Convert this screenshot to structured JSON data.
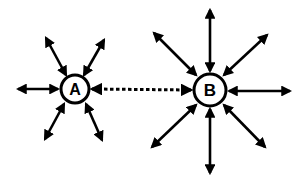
{
  "diagram": {
    "background": "#ffffff",
    "stroke_color": "#000000",
    "nodes": [
      {
        "id": "A",
        "label": "A",
        "cx": 75,
        "cy": 89,
        "r": 14,
        "font_size": 16
      },
      {
        "id": "B",
        "label": "B",
        "cx": 210,
        "cy": 90,
        "r": 16,
        "font_size": 17
      }
    ],
    "arrows": [
      {
        "name": "a-northwest",
        "x1": 46,
        "y1": 38,
        "x2": 66,
        "y2": 75,
        "style": "solid"
      },
      {
        "name": "a-northeast",
        "x1": 104,
        "y1": 40,
        "x2": 84,
        "y2": 75,
        "style": "solid"
      },
      {
        "name": "a-west",
        "x1": 18,
        "y1": 89,
        "x2": 58,
        "y2": 89,
        "style": "solid"
      },
      {
        "name": "a-southwest",
        "x1": 45,
        "y1": 139,
        "x2": 64,
        "y2": 104,
        "style": "solid"
      },
      {
        "name": "a-southeast",
        "x1": 102,
        "y1": 140,
        "x2": 86,
        "y2": 104,
        "style": "solid"
      },
      {
        "name": "a-to-b",
        "x1": 92,
        "y1": 89,
        "x2": 191,
        "y2": 90,
        "style": "dashed"
      },
      {
        "name": "b-northwest",
        "x1": 154,
        "y1": 33,
        "x2": 196,
        "y2": 75,
        "style": "solid"
      },
      {
        "name": "b-north",
        "x1": 210,
        "y1": 10,
        "x2": 210,
        "y2": 71,
        "style": "solid"
      },
      {
        "name": "b-northeast",
        "x1": 267,
        "y1": 35,
        "x2": 224,
        "y2": 75,
        "style": "solid"
      },
      {
        "name": "b-east",
        "x1": 290,
        "y1": 91,
        "x2": 229,
        "y2": 91,
        "style": "solid"
      },
      {
        "name": "b-southwest",
        "x1": 152,
        "y1": 147,
        "x2": 196,
        "y2": 105,
        "style": "solid"
      },
      {
        "name": "b-south",
        "x1": 210,
        "y1": 173,
        "x2": 210,
        "y2": 109,
        "style": "solid"
      },
      {
        "name": "b-southeast",
        "x1": 265,
        "y1": 147,
        "x2": 224,
        "y2": 105,
        "style": "solid"
      }
    ]
  }
}
